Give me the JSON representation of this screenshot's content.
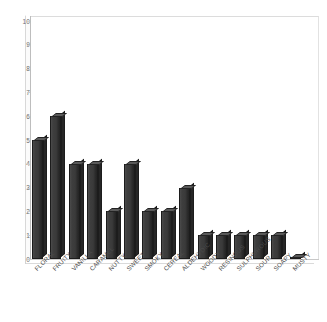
{
  "chart_data": {
    "type": "bar",
    "title": "",
    "subtitle": "",
    "xlabel": "",
    "ylabel": "",
    "ylim": [
      0,
      10
    ],
    "ytick_step": 1,
    "yticks": [
      "10",
      "9",
      "8",
      "7",
      "6",
      "5",
      "4",
      "3",
      "2",
      "1",
      "0"
    ],
    "grid": false,
    "legend": false,
    "legend_position": "none",
    "categories": [
      "FLORAL",
      "FRUITY",
      "VANILLA",
      "CARAMEL",
      "NUTTY",
      "SWEET",
      "SMOKY",
      "CEREAL",
      "ALDEHYDIC",
      "WOODY",
      "RESINOUS",
      "SULPHUROUS",
      "SOUR",
      "SOAPY",
      "MUSTY"
    ],
    "values": [
      5,
      6,
      4,
      4,
      2,
      4,
      2,
      2,
      3,
      1,
      1,
      1,
      1,
      1,
      0.05
    ],
    "bar_color": "#3a3a3a",
    "bar_edge_color": "#1c1c1c",
    "plot_background": "#ffffff",
    "axis_color": "#c0c0c0",
    "tick_label_color": "#6d6d6d",
    "category_label_color": "#4a4a4a"
  }
}
